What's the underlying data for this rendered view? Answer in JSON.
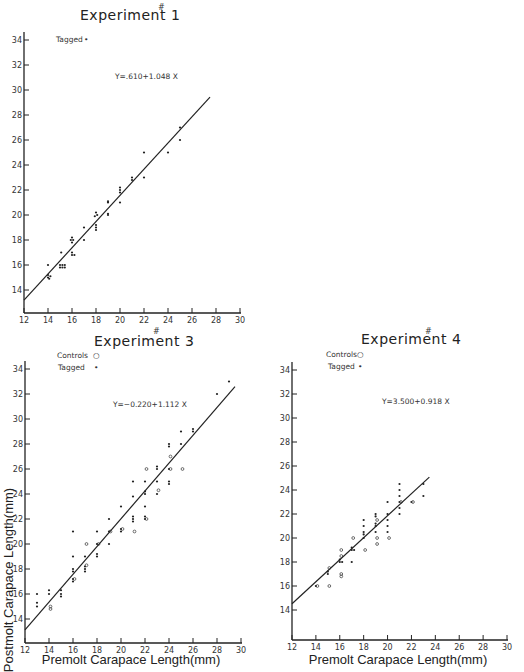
{
  "chart_data": [
    {
      "type": "scatter",
      "title": "Experiment # 1",
      "title_text": "Experiment",
      "title_number": "1",
      "title_mark": "#",
      "legend": [
        {
          "label": "Tagged",
          "marker": "•"
        }
      ],
      "equation": "Y=.610+1.048 X",
      "xlabel": "",
      "ylabel": "",
      "xlim": [
        12,
        30
      ],
      "ylim": [
        12,
        34
      ],
      "xticks": [
        12,
        14,
        16,
        18,
        20,
        22,
        24,
        26,
        28,
        30
      ],
      "yticks": [
        14,
        16,
        18,
        20,
        22,
        24,
        26,
        28,
        30,
        32,
        34
      ],
      "regression": {
        "intercept": 0.61,
        "slope": 1.048,
        "x_range": [
          12,
          27.5
        ]
      },
      "series": [
        {
          "name": "Tagged",
          "marker": "dot",
          "points": [
            [
              14,
              15
            ],
            [
              14,
              15.2
            ],
            [
              14.1,
              14.9
            ],
            [
              14.2,
              15.1
            ],
            [
              14,
              16
            ],
            [
              15,
              15.8
            ],
            [
              15.2,
              15.8
            ],
            [
              15.4,
              15.8
            ],
            [
              15,
              16
            ],
            [
              15.2,
              16
            ],
            [
              15.4,
              16
            ],
            [
              15.1,
              17
            ],
            [
              16,
              16.8
            ],
            [
              16,
              17
            ],
            [
              16.2,
              16.8
            ],
            [
              16,
              17.8
            ],
            [
              16.1,
              18
            ],
            [
              16,
              18.2
            ],
            [
              15.9,
              18
            ],
            [
              17,
              18
            ],
            [
              17,
              19
            ],
            [
              18,
              18.8
            ],
            [
              18,
              19
            ],
            [
              18,
              19.2
            ],
            [
              17.9,
              19.9
            ],
            [
              18.1,
              20
            ],
            [
              18,
              20.2
            ],
            [
              19,
              20
            ],
            [
              19,
              20.1
            ],
            [
              19,
              21
            ],
            [
              19,
              21.1
            ],
            [
              20,
              21
            ],
            [
              20,
              21.8
            ],
            [
              20,
              22
            ],
            [
              20,
              22.2
            ],
            [
              21,
              22.8
            ],
            [
              21,
              23
            ],
            [
              22,
              23
            ],
            [
              22,
              25
            ],
            [
              24,
              25
            ],
            [
              25,
              26
            ],
            [
              25,
              27
            ]
          ]
        }
      ]
    },
    {
      "type": "scatter",
      "title": "Experiment # 3",
      "title_text": "Experiment",
      "title_number": "3",
      "title_mark": "#",
      "legend": [
        {
          "label": "Controls",
          "marker": "○"
        },
        {
          "label": "Tagged",
          "marker": "•"
        }
      ],
      "equation": "Y=−0.220+1.112 X",
      "xlabel": "Premolt Carapace Length(mm)",
      "ylabel": "Postmolt Carapace Length(mm)",
      "xlim": [
        12,
        30
      ],
      "ylim": [
        12,
        34
      ],
      "xticks": [
        12,
        14,
        16,
        18,
        20,
        22,
        24,
        26,
        28,
        30
      ],
      "yticks": [
        14,
        16,
        18,
        20,
        22,
        24,
        26,
        28,
        30,
        32,
        34
      ],
      "regression": {
        "intercept": -0.22,
        "slope": 1.112,
        "x_range": [
          12,
          29.5
        ]
      },
      "series": [
        {
          "name": "Tagged",
          "marker": "dot",
          "points": [
            [
              13,
              16
            ],
            [
              13,
              15
            ],
            [
              13,
              15.3
            ],
            [
              14,
              16
            ],
            [
              14,
              16.3
            ],
            [
              15,
              16
            ],
            [
              15,
              16.3
            ],
            [
              15,
              15.8
            ],
            [
              16,
              21
            ],
            [
              16,
              19
            ],
            [
              16,
              18
            ],
            [
              16,
              17.8
            ],
            [
              16,
              17.2
            ],
            [
              16,
              17
            ],
            [
              17,
              19
            ],
            [
              17,
              18
            ],
            [
              17,
              17.8
            ],
            [
              17,
              18.2
            ],
            [
              18,
              21
            ],
            [
              18,
              19
            ],
            [
              18,
              19.2
            ],
            [
              18,
              20
            ],
            [
              19,
              20
            ],
            [
              19,
              22
            ],
            [
              19,
              21
            ],
            [
              20,
              21
            ],
            [
              20,
              21.2
            ],
            [
              20,
              23
            ],
            [
              21,
              21.8
            ],
            [
              21,
              22
            ],
            [
              21,
              22.2
            ],
            [
              21,
              23.8
            ],
            [
              21,
              25
            ],
            [
              22,
              22
            ],
            [
              22,
              22.2
            ],
            [
              22,
              23
            ],
            [
              22,
              24
            ],
            [
              22,
              25
            ],
            [
              22,
              24.2
            ],
            [
              23,
              24
            ],
            [
              23,
              25
            ],
            [
              23,
              26
            ],
            [
              23,
              26.2
            ],
            [
              24,
              26
            ],
            [
              24,
              25
            ],
            [
              24,
              24.8
            ],
            [
              24,
              28
            ],
            [
              24,
              27.8
            ],
            [
              25,
              28
            ],
            [
              25,
              29
            ],
            [
              26,
              29
            ],
            [
              26,
              29.2
            ],
            [
              28,
              32
            ],
            [
              29,
              33
            ]
          ]
        },
        {
          "name": "Controls",
          "marker": "circle",
          "points": [
            [
              14,
              14.8
            ],
            [
              14,
              15
            ],
            [
              16,
              17.2
            ],
            [
              17,
              20
            ],
            [
              17,
              18.3
            ],
            [
              18,
              20
            ],
            [
              19,
              21
            ],
            [
              20,
              21.2
            ],
            [
              21,
              21
            ],
            [
              22,
              22
            ],
            [
              22,
              26
            ],
            [
              23,
              24.3
            ],
            [
              24,
              27
            ],
            [
              24,
              26
            ],
            [
              25,
              26
            ]
          ]
        }
      ]
    },
    {
      "type": "scatter",
      "title": "Experiment # 4",
      "title_text": "Experiment",
      "title_number": "4",
      "title_mark": "#",
      "legend": [
        {
          "label": "Controls",
          "marker": "○"
        },
        {
          "label": "Tagged",
          "marker": "•"
        }
      ],
      "equation": "Y=3.500+0.918 X",
      "xlabel": "Premolt Carapace Length(mm)",
      "ylabel": "",
      "xlim": [
        12,
        30
      ],
      "ylim": [
        12,
        34
      ],
      "xticks": [
        12,
        14,
        16,
        18,
        20,
        22,
        24,
        26,
        28,
        30
      ],
      "yticks": [
        14,
        16,
        18,
        20,
        22,
        24,
        26,
        28,
        30,
        32,
        34
      ],
      "regression": {
        "intercept": 3.5,
        "slope": 0.918,
        "x_range": [
          12,
          23.5
        ]
      },
      "series": [
        {
          "name": "Tagged",
          "marker": "dot",
          "points": [
            [
              14,
              16
            ],
            [
              15,
              17
            ],
            [
              15,
              17.2
            ],
            [
              16,
              18
            ],
            [
              16,
              18.2
            ],
            [
              16.2,
              18
            ],
            [
              17,
              19
            ],
            [
              17,
              19.2
            ],
            [
              17.2,
              19
            ],
            [
              17,
              18
            ],
            [
              18,
              20.5
            ],
            [
              18,
              20
            ],
            [
              18,
              21
            ],
            [
              18,
              21.5
            ],
            [
              18,
              20.3
            ],
            [
              19,
              21
            ],
            [
              19,
              21.2
            ],
            [
              19,
              20.5
            ],
            [
              19,
              22
            ],
            [
              19,
              21.8
            ],
            [
              20,
              22
            ],
            [
              20,
              21
            ],
            [
              20,
              21.5
            ],
            [
              20,
              20.5
            ],
            [
              20,
              23
            ],
            [
              21,
              23
            ],
            [
              21,
              22.5
            ],
            [
              21,
              24.5
            ],
            [
              21,
              24
            ],
            [
              21,
              23.5
            ],
            [
              21,
              22
            ],
            [
              22,
              23
            ],
            [
              23,
              24.5
            ],
            [
              23,
              23.5
            ]
          ]
        },
        {
          "name": "Controls",
          "marker": "circle",
          "points": [
            [
              14,
              16
            ],
            [
              15,
              16
            ],
            [
              15,
              17.5
            ],
            [
              16,
              17
            ],
            [
              16,
              16.8
            ],
            [
              16,
              18.5
            ],
            [
              16,
              19
            ],
            [
              17,
              20
            ],
            [
              18,
              19
            ],
            [
              19,
              20
            ],
            [
              19,
              19.5
            ],
            [
              19,
              21.5
            ],
            [
              20,
              20
            ],
            [
              21,
              23
            ],
            [
              22,
              23
            ]
          ]
        }
      ]
    }
  ]
}
